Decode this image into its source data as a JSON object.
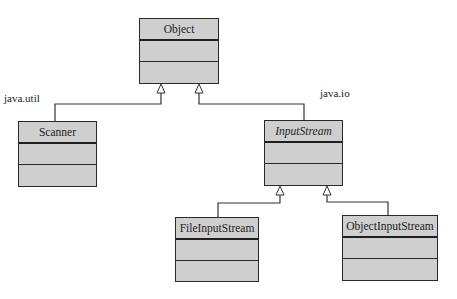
{
  "diagram": {
    "type": "UML class hierarchy",
    "packages": [
      {
        "label": "java.util"
      },
      {
        "label": "java.io"
      }
    ],
    "classes": [
      {
        "name": "Object",
        "abstract": false
      },
      {
        "name": "Scanner",
        "abstract": false,
        "package": "java.util"
      },
      {
        "name": "InputStream",
        "abstract": true,
        "package": "java.io"
      },
      {
        "name": "FileInputStream",
        "abstract": false,
        "package": "java.io"
      },
      {
        "name": "ObjectInputStream",
        "abstract": false,
        "package": "java.io"
      }
    ],
    "relationships": [
      {
        "type": "generalization",
        "from": "Scanner",
        "to": "Object"
      },
      {
        "type": "generalization",
        "from": "InputStream",
        "to": "Object"
      },
      {
        "type": "generalization",
        "from": "FileInputStream",
        "to": "InputStream"
      },
      {
        "type": "generalization",
        "from": "ObjectInputStream",
        "to": "InputStream"
      }
    ],
    "colors": {
      "box_fill": "#cfcfcf",
      "border": "#2a2a2a",
      "line": "#333333"
    }
  }
}
